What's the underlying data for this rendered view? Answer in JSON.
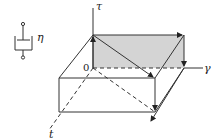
{
  "diagram": {
    "dashpot": {
      "label": "η"
    },
    "axes": {
      "vertical": "τ",
      "horizontal": "γ",
      "depth": "t",
      "origin": "0"
    },
    "colors": {
      "line": "#333333",
      "shaded_face": "#d4d4d4",
      "background": "#ffffff"
    }
  }
}
